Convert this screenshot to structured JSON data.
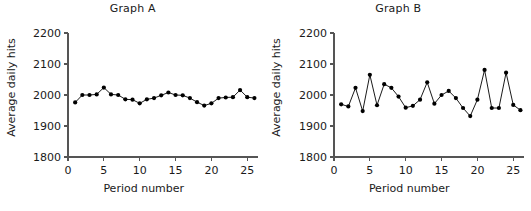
{
  "figure": {
    "background": "#ffffff",
    "marker_color": "#000000",
    "axis_color": "#555555"
  },
  "chart_data": [
    {
      "type": "line",
      "title": "Graph A",
      "xlabel": "Period number",
      "ylabel": "Average daily hits",
      "xlim": [
        0,
        26.5
      ],
      "ylim": [
        1800,
        2200
      ],
      "xticks": [
        0,
        5,
        10,
        15,
        20,
        25
      ],
      "yticks": [
        1800,
        1900,
        2000,
        2100,
        2200
      ],
      "xticklabels": [
        "0",
        "5",
        "10",
        "15",
        "20",
        "25"
      ],
      "yticklabels": [
        "1800",
        "1900",
        "2000",
        "2100",
        "2200"
      ],
      "grid": false,
      "legend": false,
      "marker": "filled-circle",
      "x": [
        1,
        2,
        3,
        4,
        5,
        6,
        7,
        8,
        9,
        10,
        11,
        12,
        13,
        14,
        15,
        16,
        17,
        18,
        19,
        20,
        21,
        22,
        23,
        24,
        25,
        26
      ],
      "values": [
        1976,
        2000,
        2000,
        2002,
        2024,
        2002,
        2000,
        1986,
        1985,
        1973,
        1986,
        1990,
        1999,
        2008,
        2000,
        1999,
        1990,
        1977,
        1966,
        1973,
        1990,
        1992,
        1993,
        2016,
        1993,
        1990
      ],
      "series": [
        {
          "name": "Graph A",
          "values": [
            1976,
            2000,
            2000,
            2002,
            2024,
            2002,
            2000,
            1986,
            1985,
            1973,
            1986,
            1990,
            1999,
            2008,
            2000,
            1999,
            1990,
            1977,
            1966,
            1973,
            1990,
            1992,
            1993,
            2016,
            1993,
            1990
          ]
        }
      ]
    },
    {
      "type": "line",
      "title": "Graph B",
      "xlabel": "Period number",
      "ylabel": "Average daily hits",
      "xlim": [
        0,
        26.5
      ],
      "ylim": [
        1800,
        2200
      ],
      "xticks": [
        0,
        5,
        10,
        15,
        20,
        25
      ],
      "yticks": [
        1800,
        1900,
        2000,
        2100,
        2200
      ],
      "xticklabels": [
        "0",
        "5",
        "10",
        "15",
        "20",
        "25"
      ],
      "yticklabels": [
        "1800",
        "1900",
        "2000",
        "2100",
        "2200"
      ],
      "grid": false,
      "legend": false,
      "marker": "filled-circle",
      "x": [
        1,
        2,
        3,
        4,
        5,
        6,
        7,
        8,
        9,
        10,
        11,
        12,
        13,
        14,
        15,
        16,
        17,
        18,
        19,
        20,
        21,
        22,
        23,
        24,
        25,
        26
      ],
      "values": [
        1970,
        1963,
        2023,
        1948,
        2065,
        1967,
        2035,
        2023,
        1995,
        1959,
        1965,
        1985,
        2041,
        1972,
        2000,
        2013,
        1990,
        1958,
        1932,
        1985,
        2081,
        1958,
        1958,
        2072,
        1968,
        1951
      ],
      "series": [
        {
          "name": "Graph B",
          "values": [
            1970,
            1963,
            2023,
            1948,
            2065,
            1967,
            2035,
            2023,
            1995,
            1959,
            1965,
            1985,
            2041,
            1972,
            2000,
            2013,
            1990,
            1958,
            1932,
            1985,
            2081,
            1958,
            1958,
            2072,
            1968,
            1951
          ]
        }
      ]
    }
  ]
}
